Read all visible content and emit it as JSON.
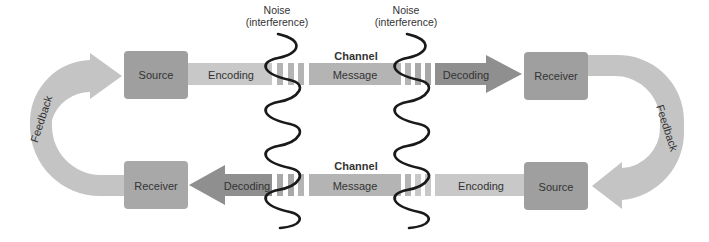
{
  "colors": {
    "box": "#9f9f9f",
    "band_light": "#c8c8c8",
    "band_mid": "#b4b4b4",
    "arrow_dark": "#8f8f8f",
    "feedback": "#c4c4c4",
    "wave": "#1a1a1a",
    "text": "#333333"
  },
  "noise": [
    {
      "line1": "Noise",
      "line2": "(interference)"
    },
    {
      "line1": "Noise",
      "line2": "(interference)"
    }
  ],
  "top_row": {
    "source": "Source",
    "encoding": "Encoding",
    "channel": "Channel",
    "message": "Message",
    "decoding": "Decoding",
    "receiver": "Receiver"
  },
  "bottom_row": {
    "receiver": "Receiver",
    "decoding": "Decoding",
    "channel": "Channel",
    "message": "Message",
    "encoding": "Encoding",
    "source": "Source"
  },
  "feedback": {
    "left": "Feedback",
    "right": "Feedback"
  }
}
